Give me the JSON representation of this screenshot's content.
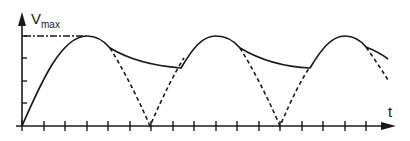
{
  "diagram": {
    "y_axis": {
      "label_main": "V",
      "label_sub": "max"
    },
    "x_axis": {
      "label": "t"
    },
    "series": [
      {
        "name": "rectified-half-sine",
        "style": "dashed"
      },
      {
        "name": "smoothed-output",
        "style": "solid"
      },
      {
        "name": "vmax-reference",
        "style": "dash-dot"
      }
    ],
    "x_tick_count": 17,
    "y_tick_count": 4,
    "colors": {
      "stroke": "#1a1a1a",
      "background": "#ffffff"
    }
  }
}
